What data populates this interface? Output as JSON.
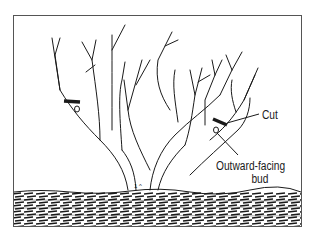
{
  "figure": {
    "title": "",
    "labels": {
      "cut": "Cut",
      "bud_line1": "Outward-facing",
      "bud_line2": "bud"
    },
    "colors": {
      "ink": "#1a1a1a",
      "frame": "#555555",
      "background": "#ffffff"
    }
  }
}
